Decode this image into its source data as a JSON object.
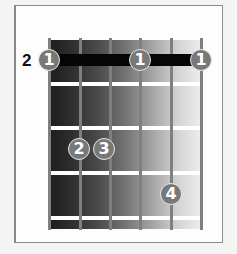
{
  "diagram": {
    "type": "guitar-chord-chart",
    "starting_fret_label": "2",
    "strings": 6,
    "frets_shown": 4,
    "colors": {
      "frame_border": "#8c8c8c",
      "string": "#7f7f7f",
      "fret_line": "#ffffff",
      "barre": "#050505",
      "finger_fill": "#787878",
      "finger_text": "#ffffff",
      "gradient_dark": "#1c1c1c",
      "gradient_light": "#efefef"
    },
    "barre": {
      "fret": 1,
      "from_string": 1,
      "to_string": 6,
      "finger": "1"
    },
    "fingers": [
      {
        "label": "1",
        "string": 1,
        "fret": 1
      },
      {
        "label": "1",
        "string": 4,
        "fret": 1
      },
      {
        "label": "1",
        "string": 6,
        "fret": 1
      },
      {
        "label": "2",
        "string": 2,
        "fret": 3
      },
      {
        "label": "3",
        "string": 3,
        "fret": 3
      },
      {
        "label": "4",
        "string": 5,
        "fret": 4
      }
    ]
  }
}
